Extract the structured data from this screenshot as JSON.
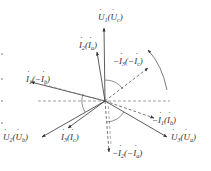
{
  "figure": {
    "type": "phasor-diagram",
    "center": {
      "x": 105,
      "y": 101
    },
    "colors": {
      "solid": "#333333",
      "dashed": "#666666",
      "background": "#ffffff"
    }
  },
  "labels": {
    "u1": {
      "main": "U",
      "sub": "1",
      "paren_main": "U",
      "paren_sub": "c",
      "text": "U̇1(U̇c)"
    },
    "i2": {
      "main": "I",
      "sub": "2",
      "paren_main": "I",
      "paren_sub": "a",
      "text": "İ2(İa)"
    },
    "neg_i3": {
      "prefix": "−",
      "main": "I",
      "sub": "3",
      "paren_prefix": "−",
      "paren_main": "I",
      "paren_sub": "c",
      "text": "−İ3(−İc)"
    },
    "i1": {
      "main": "I",
      "sub": "1",
      "paren_prefix": "−",
      "paren_main": "I",
      "paren_sub": "b",
      "text": "İ1(−İb)"
    },
    "neg_i1": {
      "prefix": "−",
      "main": "I",
      "sub": "1",
      "paren_main": "I",
      "paren_sub": "b",
      "text": "−İ1(İb)"
    },
    "u2": {
      "main": "U",
      "sub": "2",
      "paren_main": "U",
      "paren_sub": "b",
      "text": "U̇2(U̇b)"
    },
    "i3": {
      "main": "I",
      "sub": "3",
      "paren_main": "I",
      "paren_sub": "c",
      "text": "İ3(İc)"
    },
    "u3": {
      "main": "U",
      "sub": "3",
      "paren_main": "U",
      "paren_sub": "a",
      "text": "U̇3(U̇a)"
    },
    "neg_i2": {
      "prefix": "−",
      "main": "I",
      "sub": "2",
      "paren_prefix": "−",
      "paren_main": "I",
      "paren_sub": "a",
      "text": "−İ2(−İa)"
    }
  },
  "phasors": [
    {
      "id": "u1",
      "style": "solid",
      "x2": 104,
      "y2": 28
    },
    {
      "id": "i2",
      "style": "solid",
      "x2": 97,
      "y2": 52
    },
    {
      "id": "neg_i3",
      "style": "dashed",
      "x2": 148,
      "y2": 68
    },
    {
      "id": "i1",
      "style": "solid",
      "x2": 31,
      "y2": 82
    },
    {
      "id": "neg_i1",
      "style": "dashed",
      "x2": 154,
      "y2": 118
    },
    {
      "id": "u2",
      "style": "solid",
      "x2": 42,
      "y2": 137
    },
    {
      "id": "i3",
      "style": "solid",
      "x2": 68,
      "y2": 128
    },
    {
      "id": "u3",
      "style": "solid",
      "x2": 167,
      "y2": 137
    },
    {
      "id": "neg_i2",
      "style": "dashed",
      "x2": 109,
      "y2": 152
    }
  ]
}
